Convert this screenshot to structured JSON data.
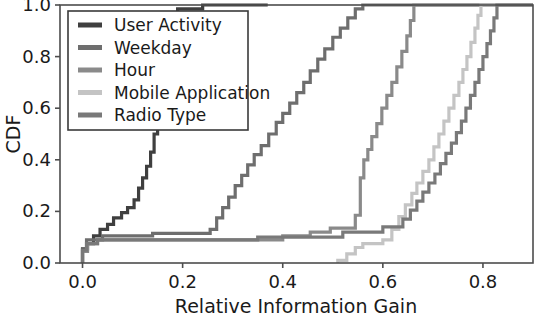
{
  "chart_data": {
    "type": "line",
    "title": "",
    "xlabel": "Relative Information Gain",
    "ylabel": "CDF",
    "xlim": [
      -0.045,
      0.9
    ],
    "ylim": [
      0.0,
      1.0
    ],
    "xticks": [
      0.0,
      0.2,
      0.4,
      0.6,
      0.8
    ],
    "xticklabels": [
      "0.0",
      "0.2",
      "0.4",
      "0.6",
      "0.8"
    ],
    "yticks": [
      0.0,
      0.2,
      0.4,
      0.6,
      0.8,
      1.0
    ],
    "yticklabels": [
      "0.0",
      "0.2",
      "0.4",
      "0.6",
      "0.8",
      "1.0"
    ],
    "grid": false,
    "legend_position": "upper left",
    "drawstyle": "steps-post",
    "series": [
      {
        "name": "User Activity",
        "color": "#3f3f3f",
        "points": [
          [
            0.0,
            0.0
          ],
          [
            0.0,
            0.055
          ],
          [
            0.01,
            0.055
          ],
          [
            0.01,
            0.075
          ],
          [
            0.022,
            0.075
          ],
          [
            0.022,
            0.105
          ],
          [
            0.035,
            0.105
          ],
          [
            0.035,
            0.13
          ],
          [
            0.05,
            0.13
          ],
          [
            0.05,
            0.15
          ],
          [
            0.062,
            0.15
          ],
          [
            0.062,
            0.175
          ],
          [
            0.078,
            0.175
          ],
          [
            0.078,
            0.195
          ],
          [
            0.09,
            0.195
          ],
          [
            0.09,
            0.215
          ],
          [
            0.103,
            0.215
          ],
          [
            0.103,
            0.245
          ],
          [
            0.112,
            0.245
          ],
          [
            0.112,
            0.29
          ],
          [
            0.12,
            0.29
          ],
          [
            0.12,
            0.33
          ],
          [
            0.128,
            0.33
          ],
          [
            0.128,
            0.375
          ],
          [
            0.136,
            0.375
          ],
          [
            0.136,
            0.43
          ],
          [
            0.143,
            0.43
          ],
          [
            0.143,
            0.5
          ],
          [
            0.15,
            0.5
          ],
          [
            0.15,
            0.58
          ],
          [
            0.157,
            0.58
          ],
          [
            0.157,
            0.66
          ],
          [
            0.163,
            0.66
          ],
          [
            0.163,
            0.74
          ],
          [
            0.168,
            0.74
          ],
          [
            0.168,
            0.82
          ],
          [
            0.173,
            0.82
          ],
          [
            0.173,
            0.9
          ],
          [
            0.18,
            0.9
          ],
          [
            0.18,
            0.96
          ],
          [
            0.19,
            0.96
          ],
          [
            0.19,
            0.985
          ],
          [
            0.24,
            0.985
          ],
          [
            0.24,
            1.0
          ],
          [
            0.37,
            1.0
          ]
        ]
      },
      {
        "name": "Weekday",
        "color": "#6e6e6e",
        "points": [
          [
            0.0,
            0.0
          ],
          [
            0.0,
            0.05
          ],
          [
            0.008,
            0.05
          ],
          [
            0.008,
            0.09
          ],
          [
            0.04,
            0.09
          ],
          [
            0.04,
            0.105
          ],
          [
            0.14,
            0.105
          ],
          [
            0.14,
            0.115
          ],
          [
            0.255,
            0.115
          ],
          [
            0.255,
            0.13
          ],
          [
            0.268,
            0.13
          ],
          [
            0.268,
            0.175
          ],
          [
            0.28,
            0.175
          ],
          [
            0.28,
            0.215
          ],
          [
            0.292,
            0.215
          ],
          [
            0.292,
            0.255
          ],
          [
            0.305,
            0.255
          ],
          [
            0.305,
            0.3
          ],
          [
            0.318,
            0.3
          ],
          [
            0.318,
            0.34
          ],
          [
            0.33,
            0.34
          ],
          [
            0.33,
            0.38
          ],
          [
            0.343,
            0.38
          ],
          [
            0.343,
            0.42
          ],
          [
            0.357,
            0.42
          ],
          [
            0.357,
            0.455
          ],
          [
            0.372,
            0.455
          ],
          [
            0.372,
            0.5
          ],
          [
            0.387,
            0.5
          ],
          [
            0.387,
            0.545
          ],
          [
            0.4,
            0.545
          ],
          [
            0.4,
            0.58
          ],
          [
            0.414,
            0.58
          ],
          [
            0.414,
            0.62
          ],
          [
            0.428,
            0.62
          ],
          [
            0.428,
            0.66
          ],
          [
            0.442,
            0.66
          ],
          [
            0.442,
            0.7
          ],
          [
            0.455,
            0.7
          ],
          [
            0.455,
            0.745
          ],
          [
            0.47,
            0.745
          ],
          [
            0.47,
            0.79
          ],
          [
            0.484,
            0.79
          ],
          [
            0.484,
            0.83
          ],
          [
            0.5,
            0.83
          ],
          [
            0.5,
            0.875
          ],
          [
            0.515,
            0.875
          ],
          [
            0.515,
            0.91
          ],
          [
            0.53,
            0.91
          ],
          [
            0.53,
            0.95
          ],
          [
            0.545,
            0.95
          ],
          [
            0.545,
            0.985
          ],
          [
            0.56,
            0.985
          ],
          [
            0.56,
            1.0
          ],
          [
            0.9,
            1.0
          ]
        ]
      },
      {
        "name": "Hour",
        "color": "#8a8a8a",
        "points": [
          [
            0.0,
            0.0
          ],
          [
            0.0,
            0.045
          ],
          [
            0.01,
            0.045
          ],
          [
            0.01,
            0.075
          ],
          [
            0.03,
            0.075
          ],
          [
            0.03,
            0.09
          ],
          [
            0.4,
            0.09
          ],
          [
            0.4,
            0.105
          ],
          [
            0.455,
            0.105
          ],
          [
            0.455,
            0.12
          ],
          [
            0.495,
            0.12
          ],
          [
            0.495,
            0.135
          ],
          [
            0.545,
            0.135
          ],
          [
            0.545,
            0.185
          ],
          [
            0.555,
            0.185
          ],
          [
            0.555,
            0.33
          ],
          [
            0.562,
            0.33
          ],
          [
            0.562,
            0.4
          ],
          [
            0.57,
            0.4
          ],
          [
            0.57,
            0.44
          ],
          [
            0.578,
            0.44
          ],
          [
            0.578,
            0.49
          ],
          [
            0.588,
            0.49
          ],
          [
            0.588,
            0.54
          ],
          [
            0.598,
            0.54
          ],
          [
            0.598,
            0.6
          ],
          [
            0.608,
            0.6
          ],
          [
            0.608,
            0.65
          ],
          [
            0.618,
            0.65
          ],
          [
            0.618,
            0.7
          ],
          [
            0.628,
            0.7
          ],
          [
            0.628,
            0.76
          ],
          [
            0.638,
            0.76
          ],
          [
            0.638,
            0.82
          ],
          [
            0.648,
            0.82
          ],
          [
            0.648,
            0.88
          ],
          [
            0.655,
            0.88
          ],
          [
            0.655,
            0.94
          ],
          [
            0.662,
            0.94
          ],
          [
            0.662,
            1.0
          ],
          [
            0.9,
            1.0
          ]
        ]
      },
      {
        "name": "Mobile Application",
        "color": "#c4c4c4",
        "points": [
          [
            0.51,
            0.0
          ],
          [
            0.51,
            0.01
          ],
          [
            0.528,
            0.01
          ],
          [
            0.528,
            0.035
          ],
          [
            0.545,
            0.035
          ],
          [
            0.545,
            0.06
          ],
          [
            0.56,
            0.06
          ],
          [
            0.56,
            0.075
          ],
          [
            0.6,
            0.075
          ],
          [
            0.6,
            0.09
          ],
          [
            0.618,
            0.09
          ],
          [
            0.618,
            0.13
          ],
          [
            0.632,
            0.13
          ],
          [
            0.632,
            0.18
          ],
          [
            0.645,
            0.18
          ],
          [
            0.645,
            0.225
          ],
          [
            0.658,
            0.225
          ],
          [
            0.658,
            0.27
          ],
          [
            0.668,
            0.27
          ],
          [
            0.668,
            0.31
          ],
          [
            0.68,
            0.31
          ],
          [
            0.68,
            0.355
          ],
          [
            0.692,
            0.355
          ],
          [
            0.692,
            0.4
          ],
          [
            0.702,
            0.4
          ],
          [
            0.702,
            0.45
          ],
          [
            0.712,
            0.45
          ],
          [
            0.712,
            0.5
          ],
          [
            0.722,
            0.5
          ],
          [
            0.722,
            0.55
          ],
          [
            0.732,
            0.55
          ],
          [
            0.732,
            0.6
          ],
          [
            0.742,
            0.6
          ],
          [
            0.742,
            0.65
          ],
          [
            0.752,
            0.65
          ],
          [
            0.752,
            0.7
          ],
          [
            0.76,
            0.7
          ],
          [
            0.76,
            0.75
          ],
          [
            0.768,
            0.75
          ],
          [
            0.768,
            0.8
          ],
          [
            0.776,
            0.8
          ],
          [
            0.776,
            0.855
          ],
          [
            0.784,
            0.855
          ],
          [
            0.784,
            0.91
          ],
          [
            0.79,
            0.91
          ],
          [
            0.79,
            0.96
          ],
          [
            0.796,
            0.96
          ],
          [
            0.796,
            1.0
          ],
          [
            0.9,
            1.0
          ]
        ]
      },
      {
        "name": "Radio Type",
        "color": "#797979",
        "points": [
          [
            0.0,
            0.0
          ],
          [
            0.0,
            0.05
          ],
          [
            0.008,
            0.05
          ],
          [
            0.008,
            0.075
          ],
          [
            0.03,
            0.075
          ],
          [
            0.03,
            0.09
          ],
          [
            0.35,
            0.09
          ],
          [
            0.35,
            0.1
          ],
          [
            0.52,
            0.1
          ],
          [
            0.52,
            0.12
          ],
          [
            0.6,
            0.12
          ],
          [
            0.6,
            0.14
          ],
          [
            0.64,
            0.14
          ],
          [
            0.64,
            0.17
          ],
          [
            0.655,
            0.17
          ],
          [
            0.655,
            0.205
          ],
          [
            0.668,
            0.205
          ],
          [
            0.668,
            0.24
          ],
          [
            0.68,
            0.24
          ],
          [
            0.68,
            0.275
          ],
          [
            0.692,
            0.275
          ],
          [
            0.692,
            0.31
          ],
          [
            0.704,
            0.31
          ],
          [
            0.704,
            0.345
          ],
          [
            0.715,
            0.345
          ],
          [
            0.715,
            0.385
          ],
          [
            0.726,
            0.385
          ],
          [
            0.726,
            0.425
          ],
          [
            0.737,
            0.425
          ],
          [
            0.737,
            0.465
          ],
          [
            0.747,
            0.465
          ],
          [
            0.747,
            0.505
          ],
          [
            0.757,
            0.505
          ],
          [
            0.757,
            0.55
          ],
          [
            0.766,
            0.55
          ],
          [
            0.766,
            0.6
          ],
          [
            0.775,
            0.6
          ],
          [
            0.775,
            0.65
          ],
          [
            0.784,
            0.65
          ],
          [
            0.784,
            0.7
          ],
          [
            0.792,
            0.7
          ],
          [
            0.792,
            0.75
          ],
          [
            0.8,
            0.75
          ],
          [
            0.8,
            0.8
          ],
          [
            0.808,
            0.8
          ],
          [
            0.808,
            0.85
          ],
          [
            0.815,
            0.85
          ],
          [
            0.815,
            0.9
          ],
          [
            0.822,
            0.9
          ],
          [
            0.822,
            0.95
          ],
          [
            0.828,
            0.95
          ],
          [
            0.828,
            1.0
          ],
          [
            0.9,
            1.0
          ]
        ]
      }
    ]
  },
  "axes": {
    "frame_color": "#4d4d4d",
    "tick_color": "#4d4d4d"
  },
  "legend": {
    "entries": [
      {
        "label": "User Activity"
      },
      {
        "label": "Weekday"
      },
      {
        "label": "Hour"
      },
      {
        "label": "Mobile Application"
      },
      {
        "label": "Radio Type"
      }
    ]
  }
}
